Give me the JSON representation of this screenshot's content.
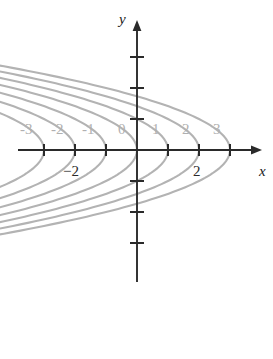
{
  "figure": {
    "name": "level-curves-plot",
    "background_color": "#ffffff",
    "axis_color": "#2a2a2a",
    "curve_color": "#b3b3b3",
    "gray_label_color": "#b0b0b0",
    "black_label_color": "#2a2a2a"
  },
  "axes": {
    "x_label": "x",
    "y_label": "y",
    "origin_px": {
      "x": 137,
      "y": 150
    },
    "unit_px": 31,
    "x_axis_start_px": 18,
    "x_axis_end_px": 262,
    "y_axis_top_px": 20,
    "y_axis_bottom_px": 282,
    "x_ticks_px": [
      44,
      75,
      106,
      168,
      199,
      230
    ],
    "y_ticks_px": [
      57,
      88,
      119,
      181,
      212,
      243
    ]
  },
  "labels": {
    "x_tick_labels_gray": [
      {
        "text": "-3",
        "x": 20,
        "y": 134
      },
      {
        "text": "-2",
        "x": 51,
        "y": 134
      },
      {
        "text": "-1",
        "x": 82,
        "y": 134
      },
      {
        "text": "0",
        "x": 118,
        "y": 134
      },
      {
        "text": "1",
        "x": 152,
        "y": 134
      },
      {
        "text": "2",
        "x": 182,
        "y": 134
      },
      {
        "text": "3",
        "x": 213,
        "y": 134
      }
    ],
    "x_tick_labels_black": [
      {
        "text": "−2",
        "x": 63,
        "y": 176
      },
      {
        "text": "2",
        "x": 193,
        "y": 176
      }
    ],
    "axis_name_x": {
      "text": "x",
      "x": 259,
      "y": 176
    },
    "axis_name_y": {
      "text": "y",
      "x": 119,
      "y": 24
    }
  },
  "chart_data": {
    "type": "line",
    "title": "",
    "xlabel": "x",
    "ylabel": "y",
    "xlim": [
      -3.8,
      4.0
    ],
    "ylim": [
      -4.2,
      4.2
    ],
    "grid": false,
    "legend": "none",
    "curve_form": "x = k - y*y",
    "series": [
      {
        "name": "k=3",
        "k": 3,
        "vertex": [
          3,
          0
        ]
      },
      {
        "name": "k=2",
        "k": 2,
        "vertex": [
          2,
          0
        ]
      },
      {
        "name": "k=1",
        "k": 1,
        "vertex": [
          1,
          0
        ]
      },
      {
        "name": "k=0",
        "k": 0,
        "vertex": [
          0,
          0
        ]
      },
      {
        "name": "k=-1",
        "k": -1,
        "vertex": [
          -1,
          0
        ]
      },
      {
        "name": "k=-2",
        "k": -2,
        "vertex": [
          -2,
          0
        ]
      },
      {
        "name": "k=-3",
        "k": -3,
        "vertex": [
          -3,
          0
        ]
      }
    ],
    "x_tick_values": [
      -3,
      -2,
      -1,
      0,
      1,
      2,
      3
    ],
    "y_tick_values": [
      -3,
      -2,
      -1,
      1,
      2,
      3
    ]
  }
}
